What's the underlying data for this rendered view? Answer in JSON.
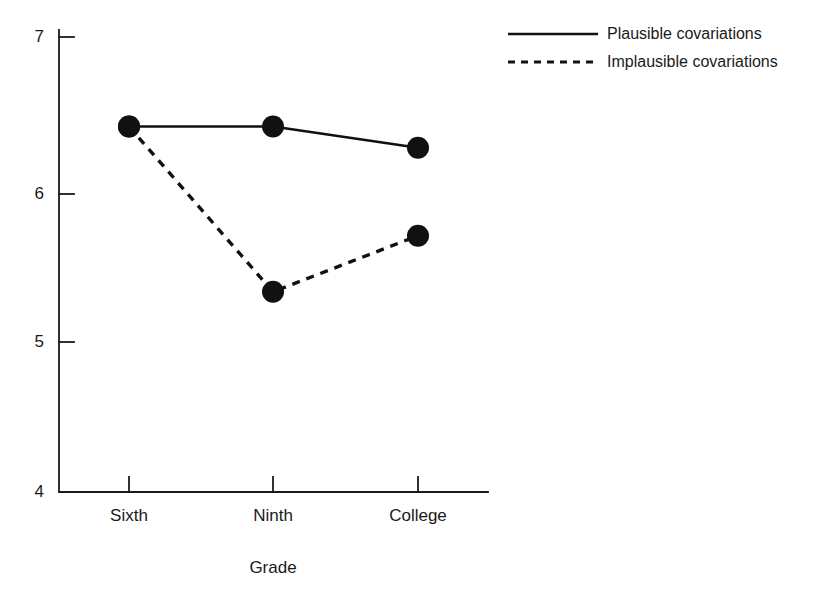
{
  "chart_data": {
    "type": "line",
    "title": "",
    "subtitle": "",
    "xlabel": "Grade",
    "ylabel": "",
    "categories": [
      "Sixth",
      "Ninth",
      "College"
    ],
    "ylim": [
      4,
      7
    ],
    "yticks": [
      4,
      5,
      6,
      7
    ],
    "ytick_labels": [
      "4",
      "5",
      "6",
      "7"
    ],
    "grid": false,
    "legend_position": "top-right",
    "series": [
      {
        "name": "Plausible covariations",
        "style": "solid",
        "color": "#111111",
        "marker": "filled-circle",
        "values": [
          6.41,
          6.41,
          6.27
        ]
      },
      {
        "name": "Implausible covariations",
        "style": "dashed",
        "color": "#111111",
        "marker": "filled-circle",
        "values": [
          6.41,
          5.32,
          5.69
        ]
      }
    ],
    "annotations": []
  },
  "axes": {
    "y_ticks": [
      {
        "label": "7",
        "value": 7
      },
      {
        "label": "6",
        "value": 6
      },
      {
        "label": "5",
        "value": 5
      },
      {
        "label": "4",
        "value": 4
      }
    ],
    "x_categories": [
      {
        "label": "Sixth"
      },
      {
        "label": "Ninth"
      },
      {
        "label": "College"
      }
    ],
    "x_title": "Grade"
  },
  "legend": {
    "entries": [
      {
        "label": "Plausible covariations",
        "style": "solid"
      },
      {
        "label": "Implausible covariations",
        "style": "dashed"
      }
    ]
  },
  "colors": {
    "ink": "#111111",
    "axis": "#1a1a1a",
    "background": "#ffffff"
  }
}
